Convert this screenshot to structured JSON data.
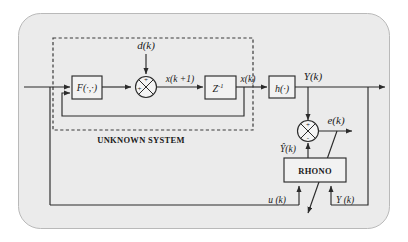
{
  "figure": {
    "kind": "block-diagram",
    "caption_unknown_system": "UNKNOWN SYSTEM",
    "background_color": "#ebebeb",
    "line_color": "#2b2b2b"
  },
  "blocks": {
    "nonlinear_map": "F(·,·)",
    "unit_delay": "Z",
    "unit_delay_exponent": "-1",
    "output_map": "h(·)",
    "observer": "RHONO"
  },
  "signals": {
    "input": "u(k)",
    "disturbance": "d(k)",
    "next_state": "x(k +1)",
    "state": "x(k)",
    "output": "Y(k)",
    "estimated_output": "Ŷ(k)",
    "error": "e(k)",
    "observer_input_u": "u (k)",
    "observer_input_y": "Y (k)"
  },
  "signs": {
    "sum1_input": "+",
    "sum1_disturbance": "+",
    "sum2_plus": "+",
    "sum2_minus": "-"
  }
}
